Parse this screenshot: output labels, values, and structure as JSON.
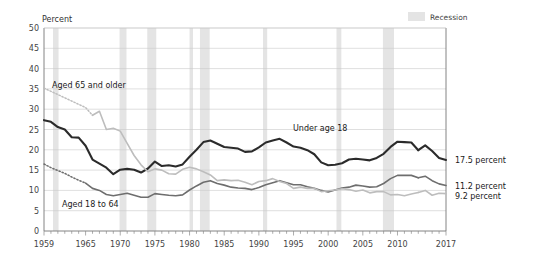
{
  "chart_data": {
    "type": "line",
    "title": "",
    "xlabel": "",
    "ylabel": "Percent",
    "ylim": [
      0,
      50
    ],
    "xlim": [
      1959,
      2017
    ],
    "yticks": [
      0,
      5,
      10,
      15,
      20,
      25,
      30,
      35,
      40,
      45,
      50
    ],
    "xticks": [
      1959,
      1965,
      1970,
      1975,
      1980,
      1985,
      1990,
      1995,
      2000,
      2005,
      2010,
      2017
    ],
    "xtick_labels": [
      "1959",
      "1965",
      "1970",
      "1975",
      "1980",
      "1985",
      "1990",
      "1995",
      "2000",
      "2005",
      "2010",
      "2017"
    ],
    "ytick_labels": [
      "0",
      "5",
      "10",
      "15",
      "20",
      "25",
      "30",
      "35",
      "40",
      "45",
      "50"
    ],
    "grid": true,
    "legend_position": "top-right",
    "x": [
      1959,
      1960,
      1961,
      1962,
      1963,
      1964,
      1965,
      1966,
      1967,
      1968,
      1969,
      1970,
      1971,
      1972,
      1973,
      1974,
      1975,
      1976,
      1977,
      1978,
      1979,
      1980,
      1981,
      1982,
      1983,
      1984,
      1985,
      1986,
      1987,
      1988,
      1989,
      1990,
      1991,
      1992,
      1993,
      1994,
      1995,
      1996,
      1997,
      1998,
      1999,
      2000,
      2001,
      2002,
      2003,
      2004,
      2005,
      2006,
      2007,
      2008,
      2009,
      2010,
      2011,
      2012,
      2013,
      2014,
      2015,
      2016,
      2017
    ],
    "series": [
      {
        "name": "Under age 18",
        "label": "Under age 18",
        "color": "#2b2b2b",
        "end_label": "17.5 percent",
        "end_value": 17.5,
        "dotted_through": null,
        "break_at": 2013,
        "values": [
          27.3,
          26.9,
          25.6,
          25.0,
          23.1,
          23.0,
          21.0,
          17.6,
          16.6,
          15.6,
          14.0,
          15.1,
          15.3,
          15.1,
          14.4,
          15.4,
          17.1,
          16.0,
          16.2,
          15.9,
          16.4,
          18.3,
          20.0,
          21.9,
          22.3,
          21.5,
          20.7,
          20.5,
          20.3,
          19.5,
          19.6,
          20.6,
          21.8,
          22.3,
          22.7,
          21.8,
          20.8,
          20.5,
          19.9,
          18.9,
          16.9,
          16.2,
          16.3,
          16.7,
          17.6,
          17.8,
          17.6,
          17.4,
          18.0,
          19.0,
          20.7,
          22.0,
          21.9,
          21.8,
          19.9,
          21.1,
          19.7,
          18.0,
          17.5
        ]
      },
      {
        "name": "Aged 18 to 64",
        "label": "Aged 18 to 64",
        "color": "#6e6e6e",
        "end_label": "11.2 percent",
        "end_value": 11.2,
        "dotted_through": 1965,
        "break_at": 2013,
        "values": [
          16.5,
          15.6,
          14.9,
          14.2,
          13.3,
          12.5,
          11.8,
          10.5,
          10.0,
          9.0,
          8.7,
          9.0,
          9.3,
          8.8,
          8.3,
          8.3,
          9.2,
          9.0,
          8.8,
          8.7,
          8.9,
          10.1,
          11.1,
          12.0,
          12.4,
          11.7,
          11.3,
          10.8,
          10.6,
          10.5,
          10.2,
          10.7,
          11.4,
          11.9,
          12.4,
          11.9,
          11.4,
          11.4,
          10.9,
          10.5,
          10.0,
          9.6,
          10.1,
          10.6,
          10.8,
          11.3,
          11.1,
          10.8,
          10.9,
          11.7,
          12.9,
          13.7,
          13.7,
          13.7,
          13.1,
          13.5,
          12.4,
          11.6,
          11.2
        ]
      },
      {
        "name": "Aged 65 and older",
        "label": "Aged 65 and older",
        "color": "#bdbdbd",
        "end_label": "9.2 percent",
        "end_value": 9.2,
        "dotted_through": 1966,
        "break_at": 2013,
        "values": [
          35.2,
          34.4,
          33.6,
          32.8,
          32.0,
          31.2,
          30.4,
          28.5,
          29.5,
          25.0,
          25.3,
          24.6,
          21.6,
          18.6,
          16.3,
          14.6,
          15.3,
          15.0,
          14.1,
          14.0,
          15.2,
          15.7,
          15.3,
          14.6,
          13.8,
          12.4,
          12.6,
          12.4,
          12.5,
          12.0,
          11.4,
          12.2,
          12.4,
          12.9,
          12.2,
          11.7,
          10.5,
          10.8,
          10.5,
          10.5,
          9.7,
          9.9,
          10.1,
          10.4,
          10.2,
          9.8,
          10.1,
          9.4,
          9.7,
          9.7,
          8.9,
          9.0,
          8.7,
          9.1,
          9.5,
          10.0,
          8.8,
          9.3,
          9.2
        ]
      }
    ],
    "recessions": [
      {
        "start": 1960.3,
        "end": 1961.1
      },
      {
        "start": 1969.9,
        "end": 1970.9
      },
      {
        "start": 1973.9,
        "end": 1975.2
      },
      {
        "start": 1980.0,
        "end": 1980.5
      },
      {
        "start": 1981.5,
        "end": 1982.9
      },
      {
        "start": 1990.6,
        "end": 1991.2
      },
      {
        "start": 2001.2,
        "end": 2001.9
      },
      {
        "start": 2007.9,
        "end": 2009.5
      }
    ]
  },
  "legend": {
    "recession_label": "Recession",
    "recession_color": "#e4e4e4"
  },
  "axis": {
    "y_title": "Percent"
  }
}
